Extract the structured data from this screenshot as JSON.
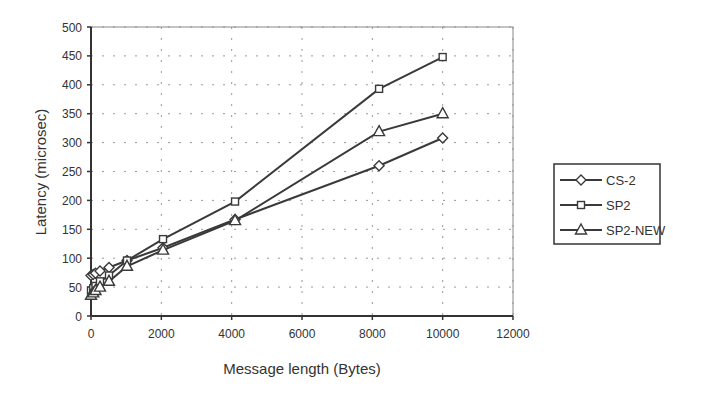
{
  "chart_data": {
    "type": "line",
    "title": "",
    "xlabel": "Message length (Bytes)",
    "ylabel": "Latency (microsec)",
    "xlim": [
      0,
      12000
    ],
    "ylim": [
      0,
      500
    ],
    "xticks": [
      0,
      2000,
      4000,
      6000,
      8000,
      10000,
      12000
    ],
    "yticks": [
      0,
      50,
      100,
      150,
      200,
      250,
      300,
      350,
      400,
      450,
      500
    ],
    "grid": "dotted",
    "legend_position": "right",
    "series": [
      {
        "name": "CS-2",
        "marker": "diamond",
        "x": [
          0,
          64,
          128,
          256,
          512,
          1024,
          2048,
          4096,
          8192,
          10000
        ],
        "y": [
          70,
          72,
          74,
          78,
          84,
          96,
          118,
          167,
          260,
          308
        ]
      },
      {
        "name": "SP2",
        "marker": "square",
        "x": [
          0,
          64,
          128,
          256,
          512,
          1024,
          2048,
          4096,
          8192,
          10000
        ],
        "y": [
          44,
          48,
          52,
          60,
          70,
          96,
          133,
          198,
          393,
          448
        ]
      },
      {
        "name": "SP2-NEW",
        "marker": "triangle",
        "x": [
          0,
          64,
          128,
          256,
          512,
          1024,
          2048,
          4096,
          8192,
          10000
        ],
        "y": [
          36,
          40,
          44,
          50,
          60,
          86,
          114,
          165,
          319,
          350
        ]
      }
    ]
  },
  "axis": {
    "x_label": "Message length (Bytes)",
    "y_label": "Latency (microsec)",
    "x_ticks": [
      "0",
      "2000",
      "4000",
      "6000",
      "8000",
      "10000",
      "12000"
    ],
    "y_ticks": [
      "0",
      "50",
      "100",
      "150",
      "200",
      "250",
      "300",
      "350",
      "400",
      "450",
      "500"
    ]
  },
  "legend": {
    "items": [
      {
        "label": "CS-2",
        "marker": "diamond"
      },
      {
        "label": "SP2",
        "marker": "square"
      },
      {
        "label": "SP2-NEW",
        "marker": "triangle"
      }
    ]
  },
  "colors": {
    "line": "#3a3a3a",
    "axis": "#333333",
    "grid": "#9a9a9a"
  }
}
